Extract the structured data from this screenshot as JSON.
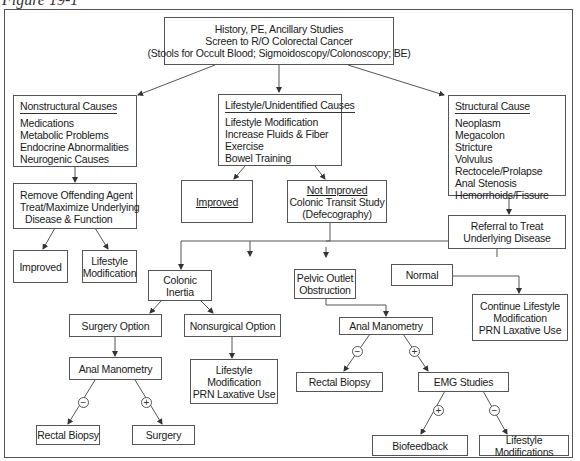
{
  "figure": {
    "caption": "Figure 19-1"
  },
  "nodes": {
    "root": {
      "lines": [
        "History, PE, Ancillary Studies",
        "Screen to R/O Colorectal Cancer",
        "(Stools for Occult Blood; Sigmoidoscopy/Colonoscopy; BE)"
      ]
    },
    "nonstructural": {
      "header": "Nonstructural Causes",
      "items": [
        "Medications",
        "Metabolic Problems",
        "Endocrine Abnormalities",
        "Neurogenic Causes"
      ]
    },
    "lifestyle": {
      "header": "Lifestyle/Unidentified Causes",
      "items": [
        "Lifestyle Modification",
        "Increase Fluids & Fiber",
        "Exercise",
        "Bowel Training"
      ]
    },
    "structural": {
      "header": "Structural Cause",
      "items": [
        "Neoplasm",
        "Megacolon",
        "Stricture",
        "Volvulus",
        "Rectocele/Prolapse",
        "Anal Stenosis",
        "Hemorrhoids/Fissure"
      ]
    },
    "remove_agent": {
      "lines": [
        "Remove Offending Agent",
        "Treat/Maximize Underlying",
        "Disease & Function"
      ]
    },
    "improved_left": {
      "label": "Improved"
    },
    "lifestyle_mod_left": {
      "lines": [
        "Lifestyle",
        "Modification"
      ]
    },
    "improved_mid": {
      "label": "Improved"
    },
    "not_improved": {
      "header": "Not Improved",
      "lines": [
        "Colonic Transit Study",
        "(Defecography)"
      ]
    },
    "referral": {
      "lines": [
        "Referral to Treat",
        "Underlying Disease"
      ]
    },
    "colonic_inertia": {
      "label": "Colonic Inertia"
    },
    "pelvic_outlet": {
      "lines": [
        "Pelvic Outlet",
        "Obstruction"
      ]
    },
    "normal": {
      "label": "Normal"
    },
    "continue_lifestyle": {
      "lines": [
        "Continue Lifestyle",
        "Modification",
        "PRN Laxative Use"
      ]
    },
    "surgery_option": {
      "label": "Surgery Option"
    },
    "nonsurgical_option": {
      "label": "Nonsurgical Option"
    },
    "anal_manometry_left": {
      "label": "Anal Manometry"
    },
    "lifestyle_prn": {
      "lines": [
        "Lifestyle",
        "Modification",
        "PRN Laxative Use"
      ]
    },
    "anal_manometry_right": {
      "label": "Anal Manometry"
    },
    "rectal_biopsy_left": {
      "label": "Rectal Biopsy"
    },
    "surgery": {
      "label": "Surgery"
    },
    "rectal_biopsy_right": {
      "label": "Rectal Biopsy"
    },
    "emg_studies": {
      "label": "EMG Studies"
    },
    "biofeedback": {
      "label": "Biofeedback"
    },
    "lifestyle_modifications": {
      "label": "Lifestyle Modifications"
    }
  },
  "signs": {
    "minus": "−",
    "plus": "+"
  }
}
